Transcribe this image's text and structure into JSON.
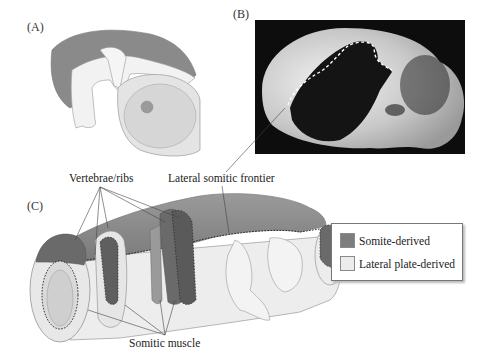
{
  "panels": {
    "a": {
      "label": "(A)"
    },
    "b": {
      "label": "(B)"
    },
    "c": {
      "label": "(C)"
    }
  },
  "callouts": {
    "vertebrae": "Vertebrae/ribs",
    "frontier": "Lateral somitic frontier",
    "muscle": "Somitic muscle"
  },
  "legend": {
    "items": [
      {
        "label": "Somite-derived",
        "color": "#7d7d7d"
      },
      {
        "label": "Lateral plate-derived",
        "color": "#ececec"
      }
    ]
  },
  "colors": {
    "somite": "#8a8a8a",
    "somite_dark": "#5e5e5e",
    "lateral": "#ececec",
    "outline": "#8c8c8c",
    "photo_bg": "#0d0d0d"
  }
}
